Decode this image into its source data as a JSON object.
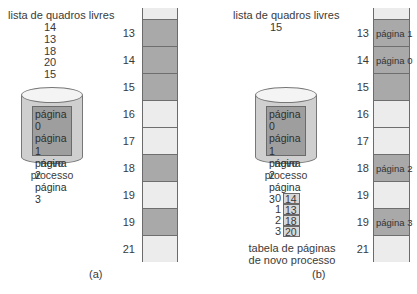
{
  "panel_a": {
    "free_list_title": "lista de quadros livres",
    "free_list": [
      "14",
      "13",
      "18",
      "20",
      "15"
    ],
    "process": {
      "pages": [
        "página 0",
        "página 1",
        "página 2",
        "página 3"
      ],
      "label_line1": "novo",
      "label_line2": "processo"
    },
    "frames": [
      {
        "number": "13",
        "state": "used",
        "content": ""
      },
      {
        "number": "14",
        "state": "used",
        "content": ""
      },
      {
        "number": "15",
        "state": "used",
        "content": ""
      },
      {
        "number": "16",
        "state": "free",
        "content": ""
      },
      {
        "number": "17",
        "state": "free",
        "content": ""
      },
      {
        "number": "18",
        "state": "used",
        "content": ""
      },
      {
        "number": "19",
        "state": "free",
        "content": ""
      },
      {
        "number": "19",
        "state": "used",
        "content": ""
      },
      {
        "number": "21",
        "state": "free",
        "content": ""
      }
    ],
    "caption": "(a)"
  },
  "panel_b": {
    "free_list_title": "lista de quadros livres",
    "free_list": [
      "15"
    ],
    "process": {
      "pages": [
        "página 0",
        "página 1",
        "página 2",
        "página 3"
      ],
      "label_line1": "novo",
      "label_line2": "processo"
    },
    "page_table": {
      "rows": [
        {
          "index": "0",
          "frame": "14"
        },
        {
          "index": "1",
          "frame": "13"
        },
        {
          "index": "2",
          "frame": "18"
        },
        {
          "index": "3",
          "frame": "20"
        }
      ],
      "label_line1": "tabela de páginas",
      "label_line2": "de novo processo"
    },
    "frames": [
      {
        "number": "13",
        "state": "used",
        "content": "página 1"
      },
      {
        "number": "14",
        "state": "used",
        "content": "página 0"
      },
      {
        "number": "15",
        "state": "used",
        "content": ""
      },
      {
        "number": "16",
        "state": "free",
        "content": ""
      },
      {
        "number": "17",
        "state": "free",
        "content": ""
      },
      {
        "number": "18",
        "state": "used",
        "content": "página 2"
      },
      {
        "number": "19",
        "state": "free",
        "content": ""
      },
      {
        "number": "19",
        "state": "used",
        "content": "página 3"
      },
      {
        "number": "21",
        "state": "free",
        "content": ""
      }
    ],
    "caption": "(b)"
  },
  "colors": {
    "used_frame": "#a9a9a9",
    "free_frame": "#ececec",
    "disk": "#cfcfcf",
    "pages_box": "#9e9e9e"
  }
}
